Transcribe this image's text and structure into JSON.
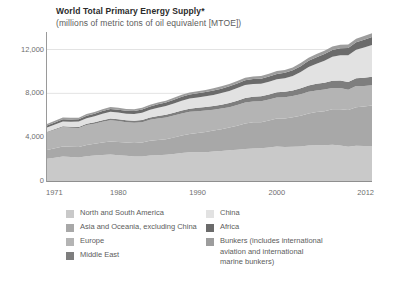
{
  "header": {
    "title": "World Total Primary Energy Supply*",
    "subtitle": "(millions of metric tons of oil equivalent [MTOE])"
  },
  "legend": {
    "left": [
      {
        "label": "North and South America",
        "color": "#c9c9c9",
        "key": "north_and_south_america"
      },
      {
        "label": "Asia and Oceania, excluding China",
        "color": "#a8a8a8",
        "key": "asia_oceania_excl_china"
      },
      {
        "label": "Europe",
        "color": "#b4b4b4",
        "key": "europe"
      },
      {
        "label": "Middle East",
        "color": "#7e7e7e",
        "key": "middle_east"
      }
    ],
    "right": [
      {
        "label": "China",
        "color": "#e2e2e2",
        "key": "china"
      },
      {
        "label": "Africa",
        "color": "#6b6b6b",
        "key": "africa"
      },
      {
        "label": "Bunkers (includes international\naviation and international\nmarine bunkers)",
        "color": "#9d9d9d",
        "key": "bunkers"
      }
    ]
  },
  "chart_data": {
    "type": "area",
    "title": "World Total Primary Energy Supply*",
    "subtitle": "(millions of metric tons of oil equivalent [MTOE])",
    "xlabel": "",
    "ylabel": "",
    "stacked": true,
    "grid": true,
    "legend_position": "bottom",
    "xlim": [
      1971,
      2012
    ],
    "ylim": [
      0,
      13600
    ],
    "yticks": [
      0,
      4000,
      8000,
      12000
    ],
    "ytick_labels": [
      "0",
      "4,000",
      "8,000",
      "12,000"
    ],
    "xticks": [
      1971,
      1980,
      1990,
      2000,
      2012
    ],
    "xtick_labels": [
      "1971",
      "1980",
      "1990",
      "2000",
      "2012"
    ],
    "x": [
      1971,
      1972,
      1973,
      1974,
      1975,
      1976,
      1977,
      1978,
      1979,
      1980,
      1981,
      1982,
      1983,
      1984,
      1985,
      1986,
      1987,
      1988,
      1989,
      1990,
      1991,
      1992,
      1993,
      1994,
      1995,
      1996,
      1997,
      1998,
      1999,
      2000,
      2001,
      2002,
      2003,
      2004,
      2005,
      2006,
      2007,
      2008,
      2009,
      2010,
      2011,
      2012
    ],
    "series": [
      {
        "name": "North and South America",
        "color": "#c9c9c9",
        "values": [
          2040,
          2130,
          2230,
          2190,
          2150,
          2260,
          2320,
          2380,
          2410,
          2360,
          2300,
          2240,
          2240,
          2330,
          2360,
          2390,
          2460,
          2560,
          2620,
          2630,
          2630,
          2690,
          2740,
          2800,
          2850,
          2930,
          2970,
          2990,
          3050,
          3140,
          3100,
          3130,
          3160,
          3240,
          3270,
          3260,
          3310,
          3250,
          3130,
          3210,
          3200,
          3190
        ]
      },
      {
        "name": "Asia and Oceania, excluding China",
        "color": "#a8a8a8",
        "values": [
          790,
          850,
          910,
          930,
          960,
          1030,
          1080,
          1130,
          1190,
          1200,
          1210,
          1230,
          1270,
          1350,
          1390,
          1430,
          1500,
          1590,
          1680,
          1760,
          1840,
          1920,
          1990,
          2090,
          2200,
          2310,
          2390,
          2380,
          2480,
          2570,
          2610,
          2690,
          2790,
          2930,
          3020,
          3100,
          3230,
          3290,
          3350,
          3530,
          3610,
          3700
        ]
      },
      {
        "name": "Europe",
        "color": "#b4b4b4",
        "values": [
          1610,
          1690,
          1780,
          1750,
          1730,
          1820,
          1830,
          1890,
          1950,
          1910,
          1860,
          1840,
          1860,
          1900,
          1950,
          1980,
          2020,
          2020,
          2010,
          1980,
          1960,
          1900,
          1880,
          1850,
          1880,
          1930,
          1900,
          1910,
          1900,
          1910,
          1930,
          1930,
          1970,
          1980,
          1980,
          1990,
          1960,
          1960,
          1850,
          1920,
          1870,
          1860
        ]
      },
      {
        "name": "Middle East",
        "color": "#7e7e7e",
        "values": [
          60,
          70,
          80,
          90,
          100,
          110,
          125,
          140,
          155,
          165,
          175,
          185,
          200,
          215,
          230,
          245,
          260,
          275,
          290,
          305,
          320,
          340,
          355,
          370,
          390,
          410,
          425,
          445,
          460,
          480,
          500,
          520,
          545,
          575,
          600,
          625,
          650,
          680,
          700,
          725,
          745,
          765
        ]
      },
      {
        "name": "China",
        "color": "#e2e2e2",
        "values": [
          390,
          420,
          440,
          450,
          480,
          510,
          550,
          600,
          620,
          610,
          600,
          620,
          660,
          710,
          760,
          790,
          840,
          890,
          930,
          950,
          980,
          1010,
          1060,
          1110,
          1160,
          1180,
          1160,
          1150,
          1160,
          1180,
          1230,
          1310,
          1480,
          1680,
          1840,
          2010,
          2180,
          2290,
          2440,
          2590,
          2760,
          2900
        ]
      },
      {
        "name": "Africa",
        "color": "#6b6b6b",
        "values": [
          180,
          190,
          200,
          210,
          215,
          225,
          235,
          245,
          255,
          265,
          275,
          285,
          295,
          305,
          315,
          325,
          340,
          350,
          360,
          375,
          385,
          395,
          405,
          420,
          430,
          445,
          455,
          465,
          480,
          495,
          505,
          520,
          540,
          560,
          580,
          600,
          620,
          645,
          665,
          685,
          705,
          725
        ]
      },
      {
        "name": "Bunkers (includes international aviation and international marine bunkers)",
        "color": "#9d9d9d",
        "values": [
          130,
          140,
          150,
          145,
          145,
          155,
          160,
          165,
          170,
          165,
          160,
          155,
          155,
          160,
          165,
          170,
          180,
          190,
          195,
          200,
          200,
          205,
          210,
          215,
          220,
          230,
          240,
          245,
          250,
          260,
          260,
          265,
          275,
          290,
          300,
          310,
          320,
          325,
          320,
          335,
          340,
          345
        ]
      }
    ],
    "totals": [
      5200,
      5490,
      5790,
      5765,
      5780,
      6110,
      6300,
      6550,
      6750,
      6675,
      6580,
      6555,
      6680,
      6970,
      7170,
      7330,
      7600,
      7875,
      8085,
      8200,
      8315,
      8460,
      8640,
      8855,
      9130,
      9435,
      9540,
      9585,
      9780,
      10035,
      10135,
      10365,
      10760,
      11255,
      11590,
      11895,
      12270,
      12440,
      12455,
      12995,
      13230,
      13405
    ]
  }
}
